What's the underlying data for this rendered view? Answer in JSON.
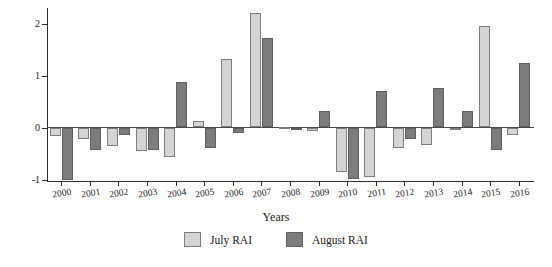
{
  "chart_data": {
    "type": "bar",
    "title": "",
    "xlabel": "Years",
    "ylabel": "RAI",
    "ylim": [
      -1.05,
      2.3
    ],
    "yticks": [
      2,
      1,
      0,
      -1
    ],
    "ytick_labels": [
      "2",
      "1",
      "0",
      "-1"
    ],
    "grid": false,
    "legend_position": "bottom-center",
    "categories": [
      "2000",
      "2001",
      "2002",
      "2003",
      "2004",
      "2005",
      "2006",
      "2007",
      "2008",
      "2009",
      "2010",
      "2011",
      "2012",
      "2013",
      "2014",
      "2015",
      "2016"
    ],
    "series": [
      {
        "name": "July RAI",
        "color": "#d4d4d4",
        "values": [
          -0.17,
          -0.23,
          -0.36,
          -0.45,
          -0.57,
          0.12,
          1.32,
          2.2,
          0.01,
          -0.06,
          -0.86,
          -0.96,
          -0.39,
          -0.34,
          -0.03,
          1.95,
          -0.14
        ]
      },
      {
        "name": "August RAI",
        "color": "#7c7c7c",
        "values": [
          -1.0,
          -0.43,
          -0.15,
          -0.44,
          0.87,
          -0.4,
          -0.1,
          1.72,
          0.0,
          0.32,
          -0.99,
          0.71,
          -0.22,
          0.76,
          0.32,
          -0.43,
          1.24
        ]
      }
    ]
  },
  "legend": {
    "entries": [
      {
        "label": "July RAI",
        "swatch": "july-swatch"
      },
      {
        "label": "August RAI",
        "swatch": "august-swatch"
      }
    ]
  },
  "axis": {
    "y_title": "RAI",
    "x_title": "Years"
  }
}
